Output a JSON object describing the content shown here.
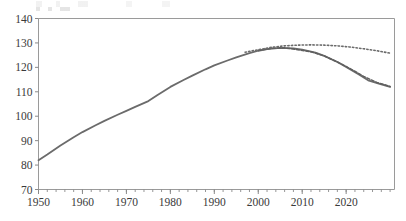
{
  "chart_data": {
    "type": "line",
    "title": "",
    "subtitle": "",
    "xlabel": "",
    "ylabel": "",
    "xlim": [
      1950,
      2031
    ],
    "ylim": [
      70,
      140
    ],
    "grid": false,
    "legend_position": "none",
    "x_ticks": [
      1950,
      1960,
      1970,
      1980,
      1990,
      2000,
      2010,
      2020
    ],
    "x_tick_labels": [
      "1950",
      "1960",
      "1970",
      "1980",
      "1990",
      "2000",
      "2010",
      "2020"
    ],
    "x_minor_tick_step": 2,
    "y_ticks": [
      70,
      80,
      90,
      100,
      110,
      120,
      130,
      140
    ],
    "y_tick_labels": [
      "70",
      "80",
      "90",
      "100",
      "110",
      "120",
      "130",
      "140"
    ],
    "series": [
      {
        "name": "observed-and-declining-projection",
        "style": "solid",
        "color": "#6b6b6b",
        "width": 1.8,
        "x": [
          1950,
          1952,
          1955,
          1958,
          1960,
          1963,
          1965,
          1968,
          1970,
          1972,
          1975,
          1977,
          1980,
          1983,
          1985,
          1988,
          1990,
          1993,
          1995,
          1998,
          2000,
          2002,
          2005,
          2008,
          2010,
          2013,
          2015,
          2018,
          2020,
          2023,
          2025,
          2028,
          2030
        ],
        "y": [
          82.0,
          84.3,
          88.0,
          91.4,
          93.5,
          96.3,
          98.1,
          100.6,
          102.2,
          103.8,
          106.2,
          108.6,
          112.0,
          114.8,
          116.6,
          119.2,
          120.8,
          122.8,
          124.1,
          125.8,
          126.8,
          127.5,
          128.0,
          127.8,
          127.3,
          126.0,
          124.7,
          122.2,
          120.2,
          117.0,
          114.7,
          113.0,
          112.0
        ]
      },
      {
        "name": "dashed-overlay-projection",
        "style": "dashed",
        "color": "#5f5f5f",
        "width": 1.5,
        "x": [
          2000,
          2003,
          2006,
          2009,
          2012,
          2015,
          2018,
          2021,
          2024,
          2027,
          2030
        ],
        "y": [
          126.9,
          127.8,
          128.0,
          127.2,
          126.4,
          124.7,
          122.2,
          119.4,
          116.3,
          113.8,
          112.2
        ]
      },
      {
        "name": "dotted-high-projection",
        "style": "dotted",
        "color": "#6b6b6b",
        "width": 1.6,
        "x": [
          1997,
          2000,
          2003,
          2006,
          2009,
          2012,
          2015,
          2018,
          2021,
          2024,
          2027,
          2030
        ],
        "y": [
          126.2,
          127.2,
          128.2,
          128.8,
          129.1,
          129.2,
          129.1,
          128.8,
          128.3,
          127.6,
          126.8,
          125.8
        ]
      }
    ],
    "annotations": [],
    "notes": {
      "peak_value": 129.2,
      "peak_year_dotted": 2012,
      "start_value": 82.0,
      "start_year": 1950,
      "end_value_solid": 112.0,
      "end_value_dotted": 125.8
    }
  },
  "axis_style": {
    "frame_color": "#9a9a9a",
    "tick_color": "#8a8a8a",
    "label_color": "#3a3a3a"
  }
}
